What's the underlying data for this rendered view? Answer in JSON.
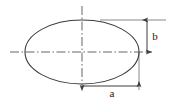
{
  "figure": {
    "type": "engineering-dimension-drawing",
    "background_color": "#ffffff",
    "line_color": "#3c3c3c",
    "centerline_color": "#555555",
    "text_color": "#1a1a1a"
  },
  "shape": {
    "name": "ellipse",
    "center_x": 82,
    "center_y": 52,
    "semi_major_axis_px": 57,
    "semi_minor_axis_px": 32,
    "stroke_width": 1
  },
  "centerlines": {
    "horizontal": {
      "name": "horizontal-centerline",
      "style": "dash-dot",
      "x1": 10,
      "x2": 152,
      "y": 52
    },
    "vertical": {
      "name": "vertical-centerline",
      "style": "dash-dot",
      "y1": 6,
      "y2": 86,
      "x": 82
    }
  },
  "dimensions": [
    {
      "id": "semi-minor",
      "label": "b",
      "orientation": "vertical",
      "label_x": 155,
      "label_y": 40,
      "arrow_x": 147,
      "arrow_y1": 20,
      "arrow_y2": 52,
      "extension_line": {
        "x1": 100,
        "x2": 166,
        "y": 20
      }
    },
    {
      "id": "semi-major",
      "label": "a",
      "orientation": "horizontal",
      "label_x": 112,
      "label_y": 97,
      "arrow_y": 86,
      "arrow_x1": 82,
      "arrow_x2": 139,
      "extension_line": {
        "x": 139,
        "y1": 52,
        "y2": 90
      }
    }
  ],
  "labels": {
    "semi_minor_axis": "b",
    "semi_major_axis": "a"
  }
}
